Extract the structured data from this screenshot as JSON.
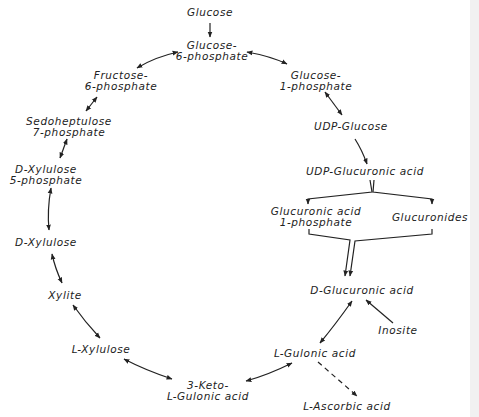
{
  "diagram": {
    "type": "metabolic-pathway",
    "nodes": {
      "glucose": {
        "line1": "Glucose"
      },
      "glucose_6p": {
        "line1": "Glucose-",
        "line2": "6-phosphate"
      },
      "glucose_1p": {
        "line1": "Glucose-",
        "line2": "1-phosphate"
      },
      "fructose_6p": {
        "line1": "Fructose-",
        "line2": "6-phosphate"
      },
      "sedoheptulose_7p": {
        "line1": "Sedoheptulose",
        "line2": "7-phosphate"
      },
      "d_xylulose_5p": {
        "line1": "D-Xylulose",
        "line2": "5-phosphate"
      },
      "d_xylulose": {
        "line1": "D-Xylulose"
      },
      "xylite": {
        "line1": "Xylite"
      },
      "l_xylulose": {
        "line1": "L-Xylulose"
      },
      "keto_gulonic": {
        "line1": "3-Keto-",
        "line2": "L-Gulonic acid"
      },
      "udp_glucose": {
        "line1": "UDP-Glucose"
      },
      "udp_glucuronic": {
        "line1": "UDP-Glucuronic acid"
      },
      "glucuronic_1p": {
        "line1": "Glucuronic acid",
        "line2": "1-phosphate"
      },
      "glucuronides": {
        "line1": "Glucuronides"
      },
      "d_glucuronic": {
        "line1": "D-Glucuronic acid"
      },
      "inosite": {
        "line1": "Inosite"
      },
      "l_gulonic": {
        "line1": "L-Gulonic acid"
      },
      "l_ascorbic": {
        "line1": "L-Ascorbic acid"
      }
    },
    "edges": [
      {
        "from": "Glucose",
        "to": "Glucose-6-phosphate",
        "style": "single"
      },
      {
        "from": "Glucose-6-phosphate",
        "to": "Fructose-6-phosphate",
        "style": "double"
      },
      {
        "from": "Glucose-6-phosphate",
        "to": "Glucose-1-phosphate",
        "style": "double"
      },
      {
        "from": "Fructose-6-phosphate",
        "to": "Sedoheptulose 7-phosphate",
        "style": "double"
      },
      {
        "from": "Sedoheptulose 7-phosphate",
        "to": "D-Xylulose 5-phosphate",
        "style": "double"
      },
      {
        "from": "D-Xylulose 5-phosphate",
        "to": "D-Xylulose",
        "style": "double"
      },
      {
        "from": "D-Xylulose",
        "to": "Xylite",
        "style": "double"
      },
      {
        "from": "Xylite",
        "to": "L-Xylulose",
        "style": "double"
      },
      {
        "from": "L-Xylulose",
        "to": "3-Keto-L-Gulonic acid",
        "style": "double"
      },
      {
        "from": "3-Keto-L-Gulonic acid",
        "to": "L-Gulonic acid",
        "style": "double"
      },
      {
        "from": "Glucose-1-phosphate",
        "to": "UDP-Glucose",
        "style": "double"
      },
      {
        "from": "UDP-Glucose",
        "to": "UDP-Glucuronic acid",
        "style": "single"
      },
      {
        "from": "UDP-Glucuronic acid",
        "to": "Glucuronic acid 1-phosphate",
        "style": "branch"
      },
      {
        "from": "UDP-Glucuronic acid",
        "to": "Glucuronides",
        "style": "branch"
      },
      {
        "from": "Glucuronic acid 1-phosphate",
        "to": "D-Glucuronic acid",
        "style": "merge"
      },
      {
        "from": "Glucuronides",
        "to": "D-Glucuronic acid",
        "style": "merge"
      },
      {
        "from": "Inosite",
        "to": "D-Glucuronic acid",
        "style": "single"
      },
      {
        "from": "D-Glucuronic acid",
        "to": "L-Gulonic acid",
        "style": "double"
      },
      {
        "from": "L-Gulonic acid",
        "to": "L-Ascorbic acid",
        "style": "dashed"
      }
    ]
  },
  "colors": {
    "ink": "#222222",
    "background": "#ffffff",
    "edge_band": "#f1f1f1"
  }
}
